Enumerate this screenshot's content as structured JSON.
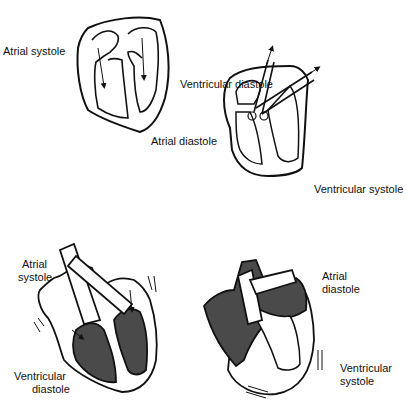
{
  "diagram": {
    "panels": [
      {
        "id": "top-left",
        "labels": [
          "Atrial systole",
          "Ventricular diastole"
        ]
      },
      {
        "id": "top-right",
        "labels": [
          "Atrial diastole",
          "Ventricular systole"
        ]
      },
      {
        "id": "bottom-left",
        "labels": [
          "Atrial systole",
          "Ventricular diastole"
        ]
      },
      {
        "id": "bottom-right",
        "labels": [
          "Atrial diastole",
          "Ventricular systole"
        ]
      }
    ],
    "labels": {
      "tl_atrial": "Atrial systole",
      "tl_ventricular": "Ventricular diastole",
      "tr_atrial": "Atrial diastole",
      "tr_ventricular": "Ventricular systole",
      "bl_atrial_1": "Atrial",
      "bl_atrial_2": "systole",
      "bl_vent_1": "Ventricular",
      "bl_vent_2": "diastole",
      "br_atrial_1": "Atrial",
      "br_atrial_2": "diastole",
      "br_vent_1": "Ventricular",
      "br_vent_2": "systole"
    },
    "colors": {
      "line": "#111111",
      "fill_dark": "#4a4a4a",
      "background": "#ffffff"
    }
  }
}
